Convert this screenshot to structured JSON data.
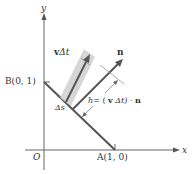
{
  "diagram": {
    "axes": {
      "x_label": "x",
      "y_label": "y",
      "origin_label": "O"
    },
    "points": {
      "B": {
        "label": "B(0, 1)"
      },
      "A": {
        "label": "A(1, 0)"
      }
    },
    "vectors": {
      "v": {
        "label_bold": "v",
        "label_rest": "Δt"
      },
      "n": {
        "label": "n"
      }
    },
    "segment": {
      "label": "Δs"
    },
    "height": {
      "label_h": "h",
      "label_eq": "= (",
      "label_v": "v",
      "label_dt": "Δt) ·",
      "label_n": "n"
    },
    "colors": {
      "line": "#555555",
      "band": "#cfcfcf",
      "axis": "#666666"
    }
  }
}
